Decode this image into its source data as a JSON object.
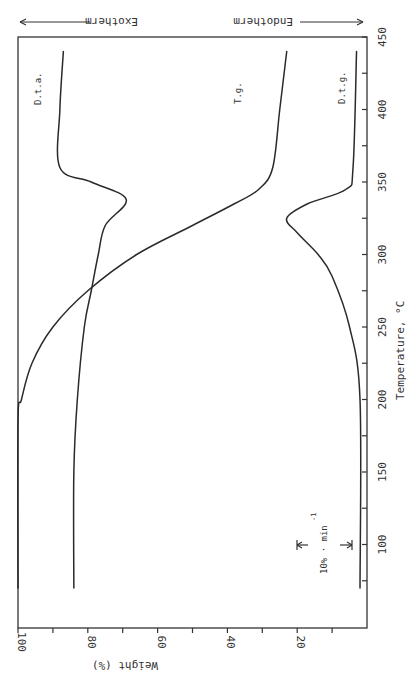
{
  "chart_data": {
    "type": "line",
    "orientation": "rotated-90",
    "title": "",
    "xlabel": "Temperature, °C",
    "ylabel": "Weight (%)",
    "xlim": [
      45,
      450
    ],
    "ylim": [
      0,
      100
    ],
    "x_ticks": [
      100,
      150,
      200,
      250,
      300,
      350,
      400,
      450
    ],
    "x_tick_labels": [
      "100",
      "150",
      "200",
      "250",
      "300",
      "350",
      "400",
      "450"
    ],
    "y_ticks": [
      100,
      80,
      60,
      40,
      20
    ],
    "y_tick_labels": [
      "100",
      "80",
      "60",
      "40",
      "20"
    ],
    "grid": false,
    "annotations": {
      "exotherm": "Exotherm",
      "endotherm": "Endotherm",
      "scale_bar": "10% · min",
      "scale_bar_exp": "-1"
    },
    "series": [
      {
        "name": "T.g.",
        "label": "T.g.",
        "x": [
          70,
          185,
          200,
          225,
          250,
          275,
          300,
          320,
          335,
          345,
          360,
          400,
          440
        ],
        "values": [
          100,
          100,
          99,
          96,
          90,
          80,
          66,
          50,
          38,
          31,
          27,
          25,
          23
        ]
      },
      {
        "name": "D.t.a.",
        "label": "D.t.a.",
        "x": [
          70,
          150,
          200,
          250,
          275,
          300,
          320,
          338,
          350,
          360,
          400,
          440
        ],
        "values": [
          84,
          84,
          83,
          81,
          79,
          77,
          75,
          69,
          79,
          88,
          88,
          87
        ]
      },
      {
        "name": "D.t.g.",
        "label": "D.t.g.",
        "x": [
          70,
          200,
          250,
          285,
          300,
          315,
          325,
          335,
          345,
          360,
          440
        ],
        "values": [
          2,
          2,
          5,
          10,
          14,
          20,
          23,
          17,
          6,
          4,
          3
        ]
      }
    ]
  }
}
